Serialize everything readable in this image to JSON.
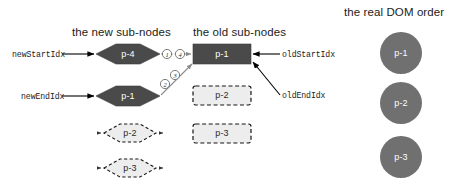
{
  "diagram": {
    "headers": {
      "new_sub_nodes": "the new sub-nodes",
      "old_sub_nodes": "the old sub-nodes",
      "real_dom_order": "the real DOM order"
    },
    "pointer_labels": {
      "new_start_idx": "newStartIdx",
      "new_end_idx": "newEndIdx",
      "old_start_idx": "oldStartIdx",
      "old_end_idx": "oldEndIdx"
    },
    "new_nodes": [
      {
        "label": "p-4",
        "style": "solid"
      },
      {
        "label": "p-1",
        "style": "solid"
      },
      {
        "label": "p-2",
        "style": "dashed"
      },
      {
        "label": "p-3",
        "style": "dashed"
      }
    ],
    "old_nodes": [
      {
        "label": "p-1",
        "style": "solid"
      },
      {
        "label": "p-2",
        "style": "dashed"
      },
      {
        "label": "p-3",
        "style": "dashed"
      }
    ],
    "dom_nodes": [
      {
        "label": "p-1"
      },
      {
        "label": "p-2"
      },
      {
        "label": "p-3"
      }
    ],
    "step_markers": [
      "1",
      "4",
      "2",
      "3"
    ],
    "colors": {
      "solid_node_fill": "#4a4a4a",
      "dashed_node_fill": "#ededed",
      "dashed_node_stroke": "#141414",
      "dom_circle_fill": "#707070",
      "text_dark": "#1c1c1c",
      "text_light": "#ffffff",
      "connector": "#8c8c8c",
      "arrow": "#000000"
    }
  }
}
